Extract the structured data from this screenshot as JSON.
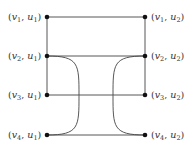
{
  "diagram": {
    "type": "graph",
    "stroke_color": "#444444",
    "node_color": "#111111",
    "nodes": [
      {
        "id": "v1u1",
        "label": {
          "v": "v",
          "vsub": "1",
          "u": "u",
          "usub": "1"
        },
        "x": 47,
        "y": 17,
        "side": "left"
      },
      {
        "id": "v2u1",
        "label": {
          "v": "v",
          "vsub": "2",
          "u": "u",
          "usub": "1"
        },
        "x": 47,
        "y": 56,
        "side": "left"
      },
      {
        "id": "v3u1",
        "label": {
          "v": "v",
          "vsub": "3",
          "u": "u",
          "usub": "1"
        },
        "x": 47,
        "y": 95,
        "side": "left"
      },
      {
        "id": "v4u1",
        "label": {
          "v": "v",
          "vsub": "4",
          "u": "u",
          "usub": "1"
        },
        "x": 47,
        "y": 135,
        "side": "left"
      },
      {
        "id": "v1u2",
        "label": {
          "v": "v",
          "vsub": "1",
          "u": "u",
          "usub": "2"
        },
        "x": 145,
        "y": 17,
        "side": "right"
      },
      {
        "id": "v2u2",
        "label": {
          "v": "v",
          "vsub": "2",
          "u": "u",
          "usub": "2"
        },
        "x": 145,
        "y": 56,
        "side": "right"
      },
      {
        "id": "v3u2",
        "label": {
          "v": "v",
          "vsub": "3",
          "u": "u",
          "usub": "2"
        },
        "x": 145,
        "y": 95,
        "side": "right"
      },
      {
        "id": "v4u2",
        "label": {
          "v": "v",
          "vsub": "4",
          "u": "u",
          "usub": "2"
        },
        "x": 145,
        "y": 135,
        "side": "right"
      }
    ],
    "edges": [
      {
        "from": "v1u1",
        "to": "v1u2",
        "kind": "straight"
      },
      {
        "from": "v2u1",
        "to": "v2u2",
        "kind": "straight"
      },
      {
        "from": "v3u1",
        "to": "v3u2",
        "kind": "straight"
      },
      {
        "from": "v4u1",
        "to": "v4u2",
        "kind": "straight"
      },
      {
        "from": "v1u1",
        "to": "v2u1",
        "kind": "straight"
      },
      {
        "from": "v2u1",
        "to": "v3u1",
        "kind": "straight"
      },
      {
        "from": "v1u2",
        "to": "v2u2",
        "kind": "straight"
      },
      {
        "from": "v2u2",
        "to": "v3u2",
        "kind": "straight"
      },
      {
        "from": "v2u1",
        "to": "v4u1",
        "kind": "curve",
        "bulge_x": 79
      },
      {
        "from": "v2u2",
        "to": "v4u2",
        "kind": "curve",
        "bulge_x": 113
      }
    ]
  }
}
